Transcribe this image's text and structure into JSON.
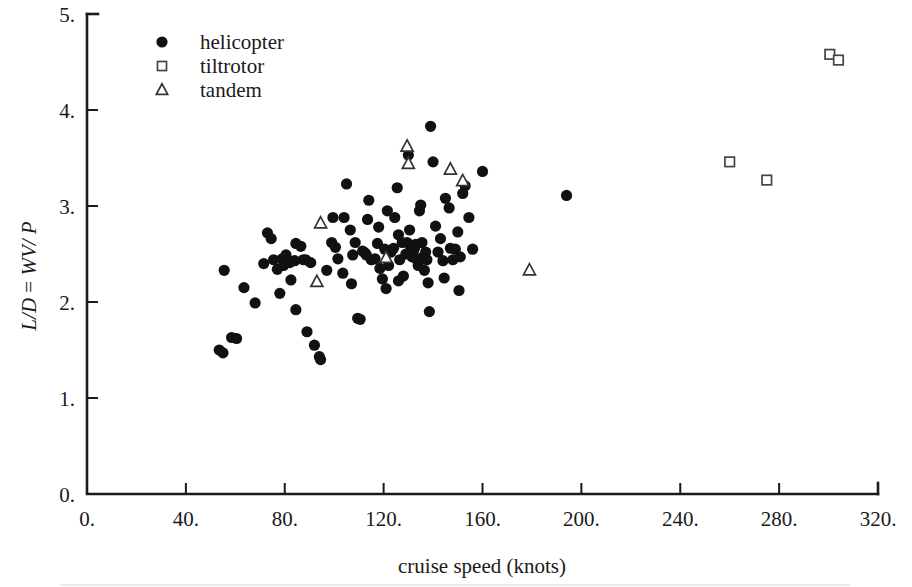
{
  "chart_data": {
    "type": "scatter",
    "title": "",
    "xlabel": "cruise speed (knots)",
    "ylabel": "L/D = WV/ P",
    "ylabel_parts": {
      "italic_1": "L/D",
      "roman_eq": " = ",
      "italic_2": "WV/ P"
    },
    "xlim": [
      0,
      320
    ],
    "ylim": [
      0,
      5
    ],
    "xticks": [
      0,
      40,
      80,
      120,
      160,
      200,
      240,
      280,
      320
    ],
    "xtick_labels": [
      "0.",
      "40.",
      "80.",
      "120.",
      "160.",
      "200.",
      "240.",
      "280.",
      "320."
    ],
    "yticks": [
      0,
      1,
      2,
      3,
      4,
      5
    ],
    "ytick_labels": [
      "0.",
      "1.",
      "2.",
      "3.",
      "4.",
      "5."
    ],
    "grid": false,
    "legend_position": "top-left",
    "legend": [
      {
        "label": "helicopter",
        "marker": "filled-circle"
      },
      {
        "label": "tiltrotor",
        "marker": "open-square"
      },
      {
        "label": "tandem",
        "marker": "open-triangle"
      }
    ],
    "series": [
      {
        "name": "helicopter",
        "marker": "filled-circle",
        "points": [
          [
            53.5,
            1.5
          ],
          [
            55.0,
            1.47
          ],
          [
            58.5,
            1.63
          ],
          [
            60.5,
            1.62
          ],
          [
            55.5,
            2.33
          ],
          [
            63.5,
            2.15
          ],
          [
            68.0,
            1.99
          ],
          [
            71.5,
            2.4
          ],
          [
            73.0,
            2.72
          ],
          [
            74.5,
            2.66
          ],
          [
            75.5,
            2.44
          ],
          [
            77.0,
            2.34
          ],
          [
            79.0,
            2.45
          ],
          [
            79.5,
            2.38
          ],
          [
            80.5,
            2.49
          ],
          [
            82.0,
            2.41
          ],
          [
            82.5,
            2.23
          ],
          [
            84.0,
            2.43
          ],
          [
            84.5,
            2.61
          ],
          [
            86.5,
            2.58
          ],
          [
            87.5,
            2.44
          ],
          [
            88.5,
            2.44
          ],
          [
            90.5,
            2.41
          ],
          [
            78.0,
            2.09
          ],
          [
            84.5,
            1.92
          ],
          [
            89.0,
            1.69
          ],
          [
            92.0,
            1.55
          ],
          [
            94.5,
            1.4
          ],
          [
            94.0,
            1.43
          ],
          [
            97.0,
            2.33
          ],
          [
            99.0,
            2.62
          ],
          [
            100.5,
            2.57
          ],
          [
            101.5,
            2.45
          ],
          [
            103.5,
            2.3
          ],
          [
            104.0,
            2.88
          ],
          [
            105.0,
            3.23
          ],
          [
            106.5,
            2.75
          ],
          [
            107.0,
            2.19
          ],
          [
            108.5,
            2.62
          ],
          [
            109.5,
            1.83
          ],
          [
            110.5,
            1.82
          ],
          [
            111.5,
            2.53
          ],
          [
            112.5,
            2.51
          ],
          [
            113.5,
            2.86
          ],
          [
            114.0,
            3.06
          ],
          [
            115.0,
            2.44
          ],
          [
            116.5,
            2.45
          ],
          [
            117.5,
            2.61
          ],
          [
            118.0,
            2.78
          ],
          [
            119.5,
            2.24
          ],
          [
            120.5,
            2.55
          ],
          [
            121.0,
            2.14
          ],
          [
            122.0,
            2.38
          ],
          [
            123.0,
            2.52
          ],
          [
            124.0,
            2.56
          ],
          [
            124.5,
            2.88
          ],
          [
            125.5,
            3.19
          ],
          [
            126.0,
            2.7
          ],
          [
            126.5,
            2.44
          ],
          [
            127.5,
            2.62
          ],
          [
            128.0,
            2.27
          ],
          [
            129.0,
            2.5
          ],
          [
            129.5,
            2.62
          ],
          [
            130.5,
            2.75
          ],
          [
            131.0,
            2.54
          ],
          [
            131.5,
            2.47
          ],
          [
            132.0,
            2.52
          ],
          [
            132.5,
            2.56
          ],
          [
            133.0,
            2.6
          ],
          [
            133.5,
            2.44
          ],
          [
            134.0,
            2.38
          ],
          [
            134.5,
            2.95
          ],
          [
            135.0,
            3.01
          ],
          [
            135.5,
            2.62
          ],
          [
            136.0,
            2.47
          ],
          [
            136.5,
            2.33
          ],
          [
            137.0,
            2.52
          ],
          [
            137.5,
            2.44
          ],
          [
            138.0,
            2.2
          ],
          [
            138.5,
            1.9
          ],
          [
            139.0,
            3.83
          ],
          [
            140.0,
            3.46
          ],
          [
            141.0,
            2.79
          ],
          [
            142.0,
            2.52
          ],
          [
            143.0,
            2.66
          ],
          [
            144.0,
            2.43
          ],
          [
            145.0,
            3.08
          ],
          [
            146.5,
            2.98
          ],
          [
            147.0,
            2.56
          ],
          [
            148.0,
            2.44
          ],
          [
            149.0,
            2.55
          ],
          [
            150.0,
            2.73
          ],
          [
            150.5,
            2.12
          ],
          [
            152.0,
            3.13
          ],
          [
            153.0,
            3.21
          ],
          [
            154.5,
            2.88
          ],
          [
            156.0,
            2.55
          ],
          [
            160.0,
            3.36
          ],
          [
            194.0,
            3.11
          ],
          [
            113.0,
            2.49
          ],
          [
            121.5,
            2.95
          ],
          [
            126.0,
            2.22
          ],
          [
            130.0,
            3.53
          ],
          [
            144.5,
            2.25
          ],
          [
            151.0,
            2.47
          ],
          [
            107.5,
            2.49
          ],
          [
            99.5,
            2.88
          ],
          [
            118.5,
            2.35
          ]
        ]
      },
      {
        "name": "tiltrotor",
        "marker": "open-square",
        "points": [
          [
            300.5,
            4.58
          ],
          [
            304.0,
            4.52
          ],
          [
            260.0,
            3.46
          ],
          [
            275.0,
            3.27
          ]
        ]
      },
      {
        "name": "tandem",
        "marker": "open-triangle",
        "points": [
          [
            93.0,
            2.21
          ],
          [
            94.5,
            2.82
          ],
          [
            129.5,
            3.62
          ],
          [
            130.0,
            3.44
          ],
          [
            121.0,
            2.46
          ],
          [
            147.0,
            3.38
          ],
          [
            152.0,
            3.26
          ],
          [
            179.0,
            2.33
          ]
        ]
      }
    ]
  },
  "axes": {
    "x_axis_name": "cruise-speed-axis",
    "y_axis_name": "lift-to-drag-axis"
  }
}
